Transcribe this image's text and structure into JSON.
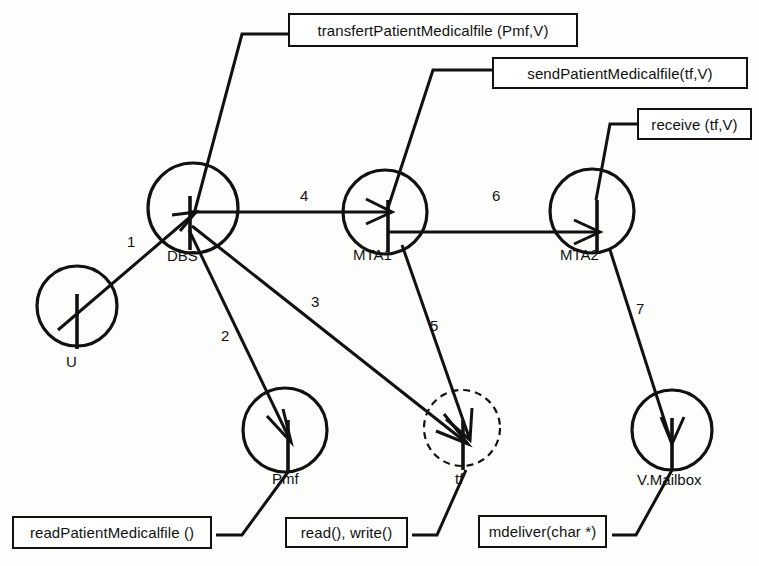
{
  "diagram": {
    "colors": {
      "stroke": "#111111",
      "background": "#fdfdfc",
      "box_fill": "#ffffff"
    },
    "nodes": [
      {
        "id": "U",
        "label": "U",
        "cx": 77,
        "cy": 306,
        "r": 40,
        "style": "solid",
        "label_x": 66,
        "label_y": 363
      },
      {
        "id": "DBS",
        "label": "DBS",
        "cx": 193,
        "cy": 208,
        "r": 45,
        "style": "solid",
        "label_x": 167,
        "label_y": 257
      },
      {
        "id": "MTA1",
        "label": "MTA1",
        "cx": 385,
        "cy": 212,
        "r": 42,
        "style": "solid",
        "label_x": 353,
        "label_y": 256
      },
      {
        "id": "MTA2",
        "label": "MTA2",
        "cx": 592,
        "cy": 211,
        "r": 42,
        "style": "solid",
        "label_x": 560,
        "label_y": 256
      },
      {
        "id": "Pmf",
        "label": "Pmf",
        "cx": 285,
        "cy": 430,
        "r": 42,
        "style": "solid",
        "label_x": 272,
        "label_y": 480
      },
      {
        "id": "tf",
        "label": "tf",
        "cx": 462,
        "cy": 428,
        "r": 38,
        "style": "dashed",
        "label_x": 455,
        "label_y": 480
      },
      {
        "id": "V.Mailbox",
        "label": "V.Mailbox",
        "cx": 672,
        "cy": 430,
        "r": 40,
        "style": "solid",
        "label_x": 637,
        "label_y": 481
      }
    ],
    "messages": [
      {
        "seq": "1",
        "from": "U",
        "to": "DBS",
        "num_x": 127,
        "num_y": 243
      },
      {
        "seq": "2",
        "from": "DBS",
        "to": "Pmf",
        "num_x": 221,
        "num_y": 337
      },
      {
        "seq": "3",
        "from": "DBS",
        "to": "tf",
        "num_x": 311,
        "num_y": 303
      },
      {
        "seq": "4",
        "from": "DBS",
        "to": "MTA1",
        "num_x": 300,
        "num_y": 197
      },
      {
        "seq": "5",
        "from": "MTA1",
        "to": "tf",
        "num_x": 430,
        "num_y": 327
      },
      {
        "seq": "6",
        "from": "MTA1",
        "to": "MTA2",
        "num_x": 492,
        "num_y": 197
      },
      {
        "seq": "7",
        "from": "MTA2",
        "to": "V.Mailbox",
        "num_x": 636,
        "num_y": 310
      }
    ],
    "operation_boxes": [
      {
        "id": "transfert",
        "text": "transfertPatientMedicalfile (Pmf,V)",
        "x": 288,
        "y": 13,
        "w": 290,
        "h": 34,
        "attaches_to": "DBS"
      },
      {
        "id": "send",
        "text": "sendPatientMedicalfile(tf,V)",
        "x": 492,
        "y": 57,
        "w": 256,
        "h": 32,
        "attaches_to": "MTA1"
      },
      {
        "id": "receive",
        "text": "receive (tf,V)",
        "x": 637,
        "y": 108,
        "w": 115,
        "h": 32,
        "attaches_to": "MTA2"
      },
      {
        "id": "readpmf",
        "text": "readPatientMedicalfile ()",
        "x": 12,
        "y": 516,
        "w": 200,
        "h": 33,
        "attaches_to": "Pmf"
      },
      {
        "id": "readwrite",
        "text": "read(), write()",
        "x": 285,
        "y": 517,
        "w": 123,
        "h": 31,
        "attaches_to": "tf"
      },
      {
        "id": "mdeliver",
        "text": "mdeliver(char *)",
        "x": 478,
        "y": 515,
        "w": 129,
        "h": 33,
        "attaches_to": "V.Mailbox"
      }
    ]
  }
}
